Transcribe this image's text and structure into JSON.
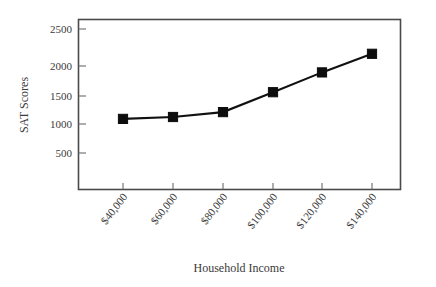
{
  "chart_data": {
    "type": "line",
    "title": "",
    "xlabel": "Household Income",
    "ylabel": "SAT Scores",
    "categories": [
      "$40,000",
      "$60,000",
      "$80,000",
      "$100,000",
      "$120,000",
      "$140,000"
    ],
    "x": [
      40000,
      60000,
      80000,
      100000,
      120000,
      140000
    ],
    "values": [
      1050,
      1080,
      1160,
      1480,
      1800,
      2100
    ],
    "series": [
      {
        "name": "SAT Scores",
        "values": [
          1050,
          1080,
          1160,
          1480,
          1800,
          2100
        ]
      }
    ],
    "ylim": [
      0,
      2700
    ],
    "xlim": [
      20000,
      152000
    ],
    "ytick_labels": [
      "500",
      "1000",
      "1500",
      "2000",
      "2500"
    ],
    "ytick_values": [
      500,
      1000,
      1500,
      2000,
      2500
    ],
    "xtick_labels": [
      "$40,000",
      "$60,000",
      "$80,000",
      "$100,000",
      "$120,000",
      "$140,000"
    ],
    "xtick_rotation_deg": 52,
    "grid": false,
    "legend": false,
    "marker": "square",
    "line_color": "#111111",
    "marker_color": "#0d0d0d",
    "frame_color": "#4a4a4a",
    "background_color": "#ffffff"
  },
  "axes": {
    "y_title": "SAT Scores",
    "x_title": "Household Income"
  }
}
